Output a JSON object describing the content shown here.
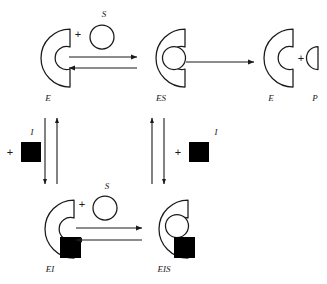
{
  "diagram": {
    "colors": {
      "stroke": "#1a1a1a",
      "inhibitor_fill": "#000000",
      "substrate_fill": "#ffffff",
      "background": "#ffffff"
    },
    "species": [
      {
        "id": "E_free",
        "label": "E",
        "name": "free-enzyme",
        "has_substrate": false,
        "has_inhibitor": false
      },
      {
        "id": "ES",
        "label": "ES",
        "name": "enzyme-substrate-complex",
        "has_substrate": true,
        "has_inhibitor": false
      },
      {
        "id": "E_out",
        "label": "E",
        "name": "regenerated-enzyme",
        "has_substrate": false,
        "has_inhibitor": false
      },
      {
        "id": "P",
        "label": "P",
        "name": "product",
        "has_substrate": false,
        "has_inhibitor": false
      },
      {
        "id": "EI",
        "label": "EI",
        "name": "enzyme-inhibitor-complex",
        "has_substrate": false,
        "has_inhibitor": true
      },
      {
        "id": "EIS",
        "label": "EIS",
        "name": "enzyme-inhibitor-substrate-complex",
        "has_substrate": true,
        "has_inhibitor": true
      }
    ],
    "reagents": {
      "substrate_symbol": "S",
      "inhibitor_symbol": "I",
      "plus_symbol": "+"
    },
    "steps": [
      {
        "id": "top_forward",
        "from": "E",
        "to": "ES",
        "reagent": "S",
        "direction": "right",
        "reversible": true
      },
      {
        "id": "catalysis",
        "from": "ES",
        "to": "E",
        "reagent": "",
        "direction": "right",
        "reversible": false
      },
      {
        "id": "left_binding",
        "from": "E",
        "to": "EI",
        "reagent": "I",
        "direction": "both",
        "reversible": true
      },
      {
        "id": "middle_binding",
        "from": "ES",
        "to": "EIS",
        "reagent": "I",
        "direction": "both",
        "reversible": true
      },
      {
        "id": "bottom_forward",
        "from": "EI",
        "to": "EIS",
        "reagent": "S",
        "direction": "right",
        "reversible": true
      }
    ],
    "labels": {
      "E_top": "E",
      "ES_top": "ES",
      "E_right": "E",
      "P_right": "P",
      "EI_bottom": "EI",
      "EIS_bottom": "EIS",
      "S_top": "S",
      "S_bottom": "S",
      "I_left": "I",
      "I_middle": "I",
      "plus_s_top": "+",
      "plus_s_bottom": "+",
      "plus_i_left": "+",
      "plus_i_middle": "+",
      "plus_product": "+"
    }
  }
}
